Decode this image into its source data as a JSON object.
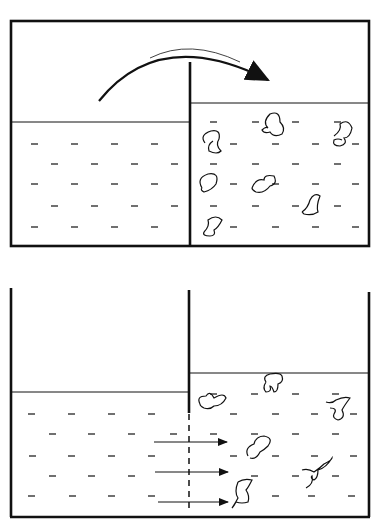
{
  "diagram": {
    "title": "",
    "panels": [
      {
        "id": "top",
        "description": "Closed container with partition; arrow indicates transfer over partition from pure solvent side to solution side containing solute particles",
        "left_compartment": {
          "contents": "solvent",
          "level": "lower-higher",
          "particles": 0
        },
        "right_compartment": {
          "contents": "solution",
          "particles": 7
        },
        "arrow": "curved-over-partition"
      },
      {
        "id": "bottom",
        "description": "Open container with semi-permeable membrane at bottom of partition; horizontal arrows show solvent flow into solution side",
        "left_compartment": {
          "contents": "solvent",
          "particles": 0
        },
        "right_compartment": {
          "contents": "solution",
          "particles": 7
        },
        "arrows": 3,
        "membrane": "dashed"
      }
    ],
    "colors": {
      "ink": "#111111",
      "background": "#ffffff"
    }
  }
}
